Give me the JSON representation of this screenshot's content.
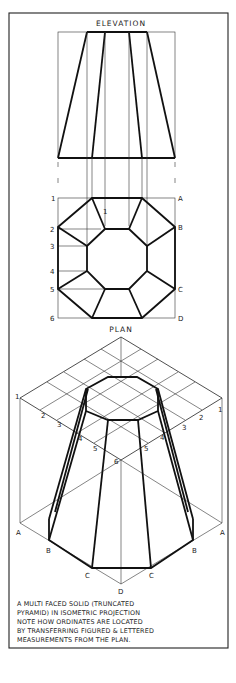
{
  "figure": {
    "elevation_title": "ELEVATION",
    "plan_title": "PLAN",
    "plan_left_labels": [
      "1",
      "2",
      "3",
      "4",
      "5",
      "6"
    ],
    "plan_right_labels": [
      "A",
      "B",
      "C",
      "D"
    ],
    "plan_inner_label": "1",
    "iso_left_numbers": [
      "1",
      "2",
      "3",
      "4",
      "5"
    ],
    "iso_right_numbers": [
      "1",
      "2",
      "3",
      "4",
      "5"
    ],
    "iso_center_label": "6",
    "iso_left_letters": [
      "A",
      "B",
      "C"
    ],
    "iso_right_letters": [
      "A",
      "B",
      "C"
    ],
    "iso_bottom_letter": "D"
  },
  "caption": {
    "lines": [
      "A MULTI FACED SOLID (TRUNCATED",
      "PYRAMID) IN ISOMETRIC PROJECTION",
      "NOTE HOW ORDINATES ARE LOCATED",
      "BY TRANSFERRING FIGURED & LETTERED",
      "MEASUREMENTS FROM THE PLAN."
    ]
  }
}
